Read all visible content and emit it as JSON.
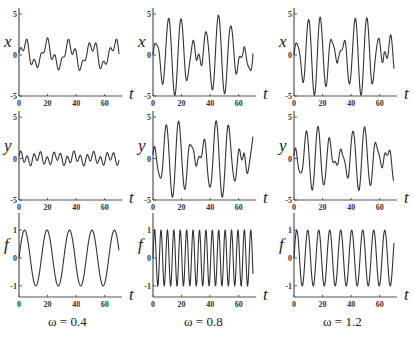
{
  "figure": {
    "columns": [
      {
        "omega_label": "ω = 0.4",
        "omega": 0.4
      },
      {
        "omega_label": "ω = 0.8",
        "omega": 0.8
      },
      {
        "omega_label": "ω = 1.2",
        "omega": 1.2
      }
    ],
    "rows": [
      {
        "ylabel": "x",
        "yticks": [
          "5",
          "0",
          "-5"
        ],
        "ylim": [
          -5,
          5
        ]
      },
      {
        "ylabel": "y",
        "yticks": [
          "5",
          "0",
          "-5"
        ],
        "ylim": [
          -5,
          5
        ]
      },
      {
        "ylabel": "f",
        "yticks": [
          "1",
          "0",
          "-1"
        ],
        "ylim": [
          -1.4,
          1.4
        ]
      }
    ],
    "xlabel": "t",
    "xticks": [
      "0",
      "20",
      "40",
      "60"
    ],
    "line_color": "#333333"
  },
  "chart_data": [
    {
      "type": "line",
      "title": "x vs t, ω=0.4",
      "xlabel": "t",
      "ylabel": "x",
      "xlim": [
        0,
        70
      ],
      "ylim": [
        -5,
        5
      ],
      "xticks": [
        0,
        20,
        40,
        60
      ],
      "yticks": [
        -5,
        0,
        5
      ],
      "description": "small oscillation, amplitude about ±1.5, period ~15.7 with secondary wiggles",
      "peaks_approx": [
        {
          "t": 4,
          "v": 1.7
        },
        {
          "t": 19,
          "v": 1.6
        },
        {
          "t": 35,
          "v": 1.8
        },
        {
          "t": 50,
          "v": 1.5
        },
        {
          "t": 66,
          "v": 1.8
        }
      ],
      "troughs_approx": [
        {
          "t": 13,
          "v": -1.2
        },
        {
          "t": 28,
          "v": -1.9
        },
        {
          "t": 44,
          "v": -1.4
        },
        {
          "t": 59,
          "v": -2.0
        }
      ]
    },
    {
      "type": "line",
      "title": "y vs t, ω=0.4",
      "xlabel": "t",
      "ylabel": "y",
      "xlim": [
        0,
        70
      ],
      "ylim": [
        -5,
        5
      ],
      "xticks": [
        0,
        20,
        40,
        60
      ],
      "yticks": [
        -5,
        0,
        5
      ],
      "description": "small fast oscillation, amplitude about ±0.8"
    },
    {
      "type": "line",
      "title": "f vs t, ω=0.4",
      "xlabel": "t",
      "ylabel": "f",
      "xlim": [
        0,
        70
      ],
      "ylim": [
        -1.4,
        1.4
      ],
      "xticks": [
        0,
        20,
        40,
        60
      ],
      "yticks": [
        -1,
        0,
        1
      ],
      "formula": "f = sin(0.4 t)",
      "amplitude": 1,
      "cycles_shown": 4.5
    },
    {
      "type": "line",
      "title": "x vs t, ω=0.8",
      "xlabel": "t",
      "ylabel": "x",
      "xlim": [
        0,
        70
      ],
      "ylim": [
        -5,
        5
      ],
      "xticks": [
        0,
        20,
        40,
        60
      ],
      "yticks": [
        -5,
        0,
        5
      ],
      "description": "beating oscillation, max amplitude ~5 near t=16 and t=47, minima of envelope near t=30 and t=62"
    },
    {
      "type": "line",
      "title": "y vs t, ω=0.8",
      "xlabel": "t",
      "ylabel": "y",
      "xlim": [
        0,
        70
      ],
      "ylim": [
        -5,
        5
      ],
      "xticks": [
        0,
        20,
        40,
        60
      ],
      "yticks": [
        -5,
        0,
        5
      ],
      "description": "beating oscillation, amplitude up to ~5"
    },
    {
      "type": "line",
      "title": "f vs t, ω=0.8",
      "xlabel": "t",
      "ylabel": "f",
      "xlim": [
        0,
        70
      ],
      "ylim": [
        -1.4,
        1.4
      ],
      "xticks": [
        0,
        20,
        40,
        60
      ],
      "yticks": [
        -1,
        0,
        1
      ],
      "amplitude": 1,
      "cycles_shown": 16
    },
    {
      "type": "line",
      "title": "x vs t, ω=1.2",
      "xlabel": "t",
      "ylabel": "x",
      "xlim": [
        0,
        70
      ],
      "ylim": [
        -5,
        5
      ],
      "xticks": [
        0,
        20,
        40,
        60
      ],
      "yticks": [
        -5,
        0,
        5
      ],
      "description": "beating oscillation, max amplitude ~5 near t=15 and t=47"
    },
    {
      "type": "line",
      "title": "y vs t, ω=1.2",
      "xlabel": "t",
      "ylabel": "y",
      "xlim": [
        0,
        70
      ],
      "ylim": [
        -5,
        5
      ],
      "xticks": [
        0,
        20,
        40,
        60
      ],
      "yticks": [
        -5,
        0,
        5
      ],
      "description": "beating oscillation, amplitude up to ~4"
    },
    {
      "type": "line",
      "title": "f vs t, ω=1.2",
      "xlabel": "t",
      "ylabel": "f",
      "xlim": [
        0,
        70
      ],
      "ylim": [
        -1.4,
        1.4
      ],
      "xticks": [
        0,
        20,
        40,
        60
      ],
      "yticks": [
        -1,
        0,
        1
      ],
      "amplitude": 1,
      "cycles_shown": 9
    }
  ]
}
